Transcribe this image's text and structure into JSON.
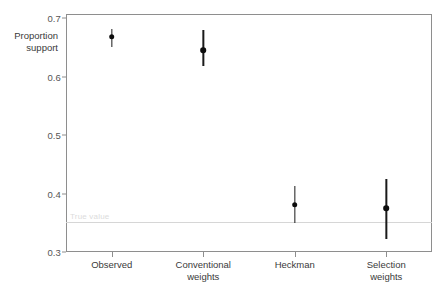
{
  "chart_data": {
    "type": "scatter",
    "title": "",
    "subtitle": "",
    "xlabel": "",
    "ylabel": "Proportion\nsupport",
    "ylabel_line1": "Proportion",
    "ylabel_line2": "support",
    "categories": [
      "Observed",
      "Conventional weights",
      "Heckman",
      "Selection weights"
    ],
    "category_labels": [
      "Observed",
      "Conventional\nweights",
      "Heckman",
      "Selection\nweights"
    ],
    "values": [
      0.668,
      0.645,
      0.381,
      0.375
    ],
    "ci_low": [
      0.65,
      0.618,
      0.35,
      0.322
    ],
    "ci_high": [
      0.682,
      0.68,
      0.412,
      0.425
    ],
    "ylim": [
      0.3,
      0.7
    ],
    "yticks": [
      0.7,
      0.6,
      0.5,
      0.4,
      0.3
    ],
    "ytick_labels": [
      "0.7",
      "0.6",
      "0.5",
      "0.4",
      "0.3"
    ],
    "grid": false,
    "legend": "none",
    "annotations": [
      {
        "name": "true-value",
        "label": "True value",
        "y": 0.352,
        "type": "hline"
      }
    ],
    "series": [
      {
        "name": "estimate",
        "marker": "filled-circle",
        "color": "#0d0d0d",
        "errorbar": "vertical-line"
      }
    ]
  },
  "colors": {
    "marker": "#0d0d0d",
    "whisker": "#1a1a1a",
    "frame": "#8e8e8e",
    "reference_line": "#d6d6d6",
    "reference_label": "#dcdcdc",
    "tick_label": "#555555",
    "axis_title": "#3a3a3a",
    "background": "#ffffff"
  }
}
